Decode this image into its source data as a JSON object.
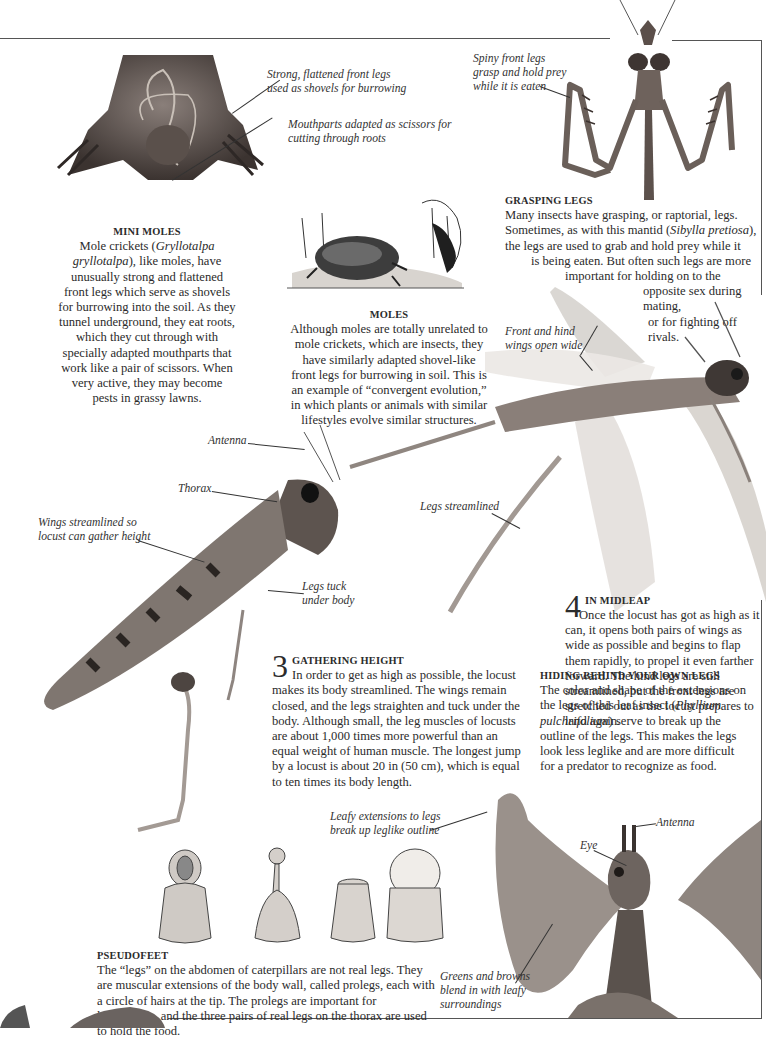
{
  "sections": {
    "mini_moles": {
      "heading": "MINI MOLES",
      "body_pre": "Mole crickets (",
      "body_species": "Gryllotalpa gryllotalpa",
      "body_post": "), like moles, have unusually strong and flattened front legs which serve as shovels for burrowing into the soil. As they tunnel underground, they eat roots, which they cut through with specially adapted mouthparts that work like a pair of scissors. When very active, they may become pests in grassy lawns."
    },
    "moles": {
      "heading": "MOLES",
      "body": "Although moles are totally unrelated to mole crickets, which are insects, they have similarly adapted shovel-like front legs for burrowing in soil. This is an example of “convergent evolution,” in which plants or animals with similar lifestyles evolve similar structures."
    },
    "grasping_legs": {
      "heading": "GRASPING LEGS",
      "lines": [
        "Many insects have grasping, or raptorial, legs.",
        "Sometimes, as with this mantid (",
        "Sibylla pretiosa",
        "),",
        "the legs are used to grab and hold prey while it",
        "is being eaten. But often such legs are more",
        "important for holding on to the",
        "opposite sex during mating,",
        "or for fighting off rivals."
      ]
    },
    "gathering_height": {
      "number": "3",
      "heading": "GATHERING HEIGHT",
      "body": "In order to get as high as possible, the locust makes its body streamlined. The wings remain closed, and the legs straighten and tuck under the body. Although small, the leg muscles of locusts are about 1,000 times more powerful than an equal weight of human muscle. The longest jump by a locust is about 20 in (50 cm), which is equal to ten times its body length."
    },
    "in_midleap": {
      "number": "4",
      "heading": "IN MIDLEAP",
      "body": "Once the locust has got as high as it can, it opens both pairs of wings as wide as possible and begins to flap them rapidly, to propel it even farther forward. The hind legs are still streamlined, but the front legs are stretched out as the locust prepares to land again."
    },
    "hiding": {
      "heading": "HIDING BEHIND YOUR OWN LEGS",
      "body_pre": "The color and shape of the extensions on the legs of this leaf insect (",
      "body_species": "Phyllium pulchrifolium",
      "body_post": ") serve to break up the outline of the legs. This makes the legs look less leglike and are more difficult for a predator to recognize as food."
    },
    "pseudofeet": {
      "heading": "PSEUDOFEET",
      "body": "The “legs” on the abdomen of caterpillars are not real legs. They are muscular extensions of the body wall, called prolegs, each with a circle of hairs at the tip. The prolegs are important for locomotion, and the three pairs of real legs on the thorax are used to hold the food."
    }
  },
  "captions": {
    "mole_legs": "Strong, flattened front legs\nused as shovels for burrowing",
    "mole_mouthparts": "Mouthparts adapted as scissors for\ncutting through roots",
    "mantid_legs": "Spiny front legs\ngrasp and hold prey\nwhile it is eaten",
    "front_hind_wings": "Front and hind\nwings open wide",
    "antenna_locust": "Antenna",
    "thorax": "Thorax",
    "wings_streamlined": "Wings streamlined so\nlocust can gather height",
    "legs_tuck": "Legs tuck\nunder body",
    "legs_streamlined": "Legs streamlined",
    "leafy_extensions": "Leafy extensions to legs\nbreak up leglike outline",
    "leaf_antenna": "Antenna",
    "leaf_eye": "Eye",
    "greens_browns": "Greens and browns\nblend in with leafy\nsurroundings"
  },
  "colors": {
    "ink": "#2b2b2b",
    "rule": "#555555",
    "paper": "#ffffff"
  }
}
